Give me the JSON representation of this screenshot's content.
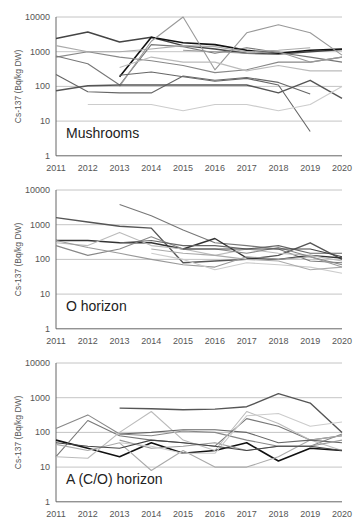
{
  "figure": {
    "y_axis_label": "Cs-137 (Bq/kg DW)",
    "x_ticks": [
      "2011",
      "2012",
      "2013",
      "2014",
      "2015",
      "2016",
      "2017",
      "2018",
      "2019",
      "2020"
    ],
    "y_ticks": [
      "1",
      "10",
      "100",
      "1000",
      "10000"
    ]
  },
  "chart_data": [
    {
      "type": "line",
      "title": "Mushrooms",
      "xlabel": "",
      "ylabel": "Cs-137 (Bq/kg DW)",
      "yscale": "log",
      "ylim": [
        1,
        10000
      ],
      "grid": true,
      "categories": [
        2011,
        2012,
        2013,
        2014,
        2015,
        2016,
        2017,
        2018,
        2019,
        2020
      ],
      "series": [
        {
          "name": "s1",
          "color": "#444444",
          "width": 1.4,
          "values": [
            2400,
            3700,
            1900,
            2600,
            1500,
            1200,
            900,
            850,
            1000,
            1150
          ]
        },
        {
          "name": "s2",
          "color": "#111111",
          "width": 1.6,
          "values": [
            null,
            null,
            190,
            2600,
            1800,
            1600,
            1100,
            900,
            1100,
            1200
          ]
        },
        {
          "name": "s3",
          "color": "#888888",
          "width": 1.1,
          "values": [
            700,
            1000,
            700,
            550,
            400,
            250,
            300,
            500,
            500,
            700
          ]
        },
        {
          "name": "s4",
          "color": "#777777",
          "width": 1.1,
          "values": [
            750,
            450,
            110,
            1600,
            1400,
            900,
            1300,
            950,
            700,
            500
          ]
        },
        {
          "name": "s5",
          "color": "#aaaaaa",
          "width": 1.1,
          "values": [
            1500,
            1000,
            1000,
            1200,
            1500,
            1400,
            1000,
            1100,
            1300,
            null
          ]
        },
        {
          "name": "s6",
          "color": "#999999",
          "width": 1.1,
          "values": [
            null,
            null,
            100,
            2000,
            10000,
            300,
            3500,
            6000,
            3500,
            800
          ]
        },
        {
          "name": "s7",
          "color": "#666666",
          "width": 1.1,
          "values": [
            220,
            70,
            65,
            65,
            200,
            150,
            180,
            130,
            60,
            null
          ]
        },
        {
          "name": "s8",
          "color": "#555555",
          "width": 1.4,
          "values": [
            75,
            105,
            110,
            110,
            110,
            110,
            110,
            65,
            150,
            45
          ]
        },
        {
          "name": "s9",
          "color": "#666666",
          "width": 1.1,
          "values": [
            null,
            null,
            210,
            260,
            190,
            140,
            170,
            110,
            5,
            null
          ]
        },
        {
          "name": "s10",
          "color": "#cccccc",
          "width": 1.1,
          "values": [
            null,
            30,
            30,
            30,
            20,
            30,
            30,
            20,
            30,
            100
          ]
        },
        {
          "name": "s11",
          "color": "#bbbbbb",
          "width": 1.1,
          "values": [
            null,
            null,
            350,
            700,
            500,
            500,
            280,
            400,
            280,
            280
          ]
        },
        {
          "name": "s12",
          "color": "#999999",
          "width": 1.1,
          "values": [
            null,
            null,
            null,
            null,
            1100,
            1000,
            900,
            1000,
            500,
            700
          ]
        }
      ]
    },
    {
      "type": "line",
      "title": "O horizon",
      "xlabel": "",
      "ylabel": "Cs-137 (Bq/kg DW)",
      "yscale": "log",
      "ylim": [
        1,
        10000
      ],
      "grid": true,
      "categories": [
        2011,
        2012,
        2013,
        2014,
        2015,
        2016,
        2017,
        2018,
        2019,
        2020
      ],
      "series": [
        {
          "name": "s1",
          "color": "#555555",
          "width": 1.4,
          "values": [
            1600,
            1200,
            900,
            800,
            80,
            90,
            100,
            130,
            300,
            100
          ]
        },
        {
          "name": "s2",
          "color": "#777777",
          "width": 1.1,
          "values": [
            null,
            null,
            3800,
            1800,
            700,
            300,
            250,
            200,
            90,
            80
          ]
        },
        {
          "name": "s3",
          "color": "#333333",
          "width": 1.4,
          "values": [
            350,
            350,
            300,
            300,
            200,
            400,
            110,
            100,
            130,
            110
          ]
        },
        {
          "name": "s4",
          "color": "#bbbbbb",
          "width": 1.1,
          "values": [
            300,
            250,
            600,
            250,
            200,
            130,
            200,
            150,
            130,
            90
          ]
        },
        {
          "name": "s5",
          "color": "#888888",
          "width": 1.1,
          "values": [
            250,
            130,
            200,
            450,
            200,
            200,
            150,
            220,
            120,
            70
          ]
        },
        {
          "name": "s6",
          "color": "#999999",
          "width": 1.1,
          "values": [
            350,
            220,
            150,
            100,
            70,
            60,
            120,
            100,
            120,
            60
          ]
        },
        {
          "name": "s7",
          "color": "#666666",
          "width": 1.1,
          "values": [
            null,
            null,
            300,
            350,
            250,
            250,
            200,
            250,
            150,
            150
          ]
        },
        {
          "name": "s8",
          "color": "#cccccc",
          "width": 1.1,
          "values": [
            null,
            null,
            null,
            150,
            100,
            50,
            80,
            70,
            60,
            40
          ]
        },
        {
          "name": "s9",
          "color": "#aaaaaa",
          "width": 1.1,
          "values": [
            null,
            null,
            null,
            200,
            150,
            130,
            100,
            90,
            50,
            60
          ]
        },
        {
          "name": "s10",
          "color": "#444444",
          "width": 1.1,
          "values": [
            null,
            null,
            null,
            null,
            200,
            200,
            200,
            200,
            200,
            120
          ]
        }
      ]
    },
    {
      "type": "line",
      "title": "A (C/O) horizon",
      "xlabel": "",
      "ylabel": "Cs-137 (Bq/kg DW)",
      "yscale": "log",
      "ylim": [
        1,
        10000
      ],
      "grid": true,
      "categories": [
        2011,
        2012,
        2013,
        2014,
        2015,
        2016,
        2017,
        2018,
        2019,
        2020
      ],
      "series": [
        {
          "name": "s1",
          "color": "#555555",
          "width": 1.4,
          "values": [
            null,
            null,
            500,
            480,
            450,
            470,
            550,
            1300,
            700,
            100
          ]
        },
        {
          "name": "s2",
          "color": "#111111",
          "width": 1.6,
          "values": [
            60,
            35,
            20,
            50,
            25,
            30,
            50,
            15,
            35,
            30
          ]
        },
        {
          "name": "s3",
          "color": "#888888",
          "width": 1.1,
          "values": [
            130,
            320,
            90,
            80,
            110,
            100,
            60,
            40,
            40,
            90
          ]
        },
        {
          "name": "s4",
          "color": "#777777",
          "width": 1.1,
          "values": [
            20,
            220,
            80,
            60,
            50,
            40,
            250,
            150,
            60,
            80
          ]
        },
        {
          "name": "s5",
          "color": "#bbbbbb",
          "width": 1.1,
          "values": [
            20,
            18,
            100,
            400,
            60,
            30,
            400,
            180,
            60,
            30
          ]
        },
        {
          "name": "s6",
          "color": "#aaaaaa",
          "width": 1.1,
          "values": [
            45,
            30,
            50,
            8,
            30,
            10,
            10,
            20,
            60,
            80
          ]
        },
        {
          "name": "s7",
          "color": "#666666",
          "width": 1.1,
          "values": [
            null,
            null,
            90,
            100,
            120,
            120,
            100,
            50,
            60,
            50
          ]
        },
        {
          "name": "s8",
          "color": "#999999",
          "width": 1.1,
          "values": [
            null,
            null,
            60,
            35,
            40,
            50,
            30,
            40,
            40,
            60
          ]
        },
        {
          "name": "s9",
          "color": "#cccccc",
          "width": 1.1,
          "values": [
            null,
            null,
            50,
            40,
            25,
            25,
            300,
            350,
            150,
            200
          ]
        },
        {
          "name": "s10",
          "color": "#444444",
          "width": 1.1,
          "values": [
            50,
            40,
            35,
            60,
            50,
            40,
            30,
            40,
            40,
            30
          ]
        }
      ]
    }
  ],
  "panels": [
    {
      "label": "Mushrooms",
      "top": 17
    },
    {
      "label": "O horizon",
      "top": 190
    },
    {
      "label": "A (C/O) horizon",
      "top": 363
    }
  ]
}
